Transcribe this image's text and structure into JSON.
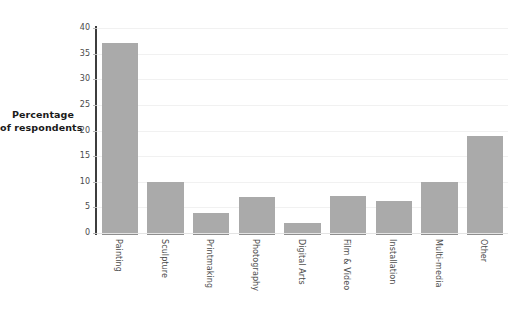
{
  "chart_data": {
    "type": "bar",
    "title": "",
    "subtitle": "",
    "xlabel": "",
    "ylabel": "Percentage of respondents",
    "ylabel_lines": [
      "Percentage",
      "of respondents"
    ],
    "categories": [
      "Painting",
      "Sculpture",
      "Printmaking",
      "Photography",
      "Digital Arts",
      "Film & Video",
      "Installation",
      "Multi-media",
      "Other"
    ],
    "values": [
      37,
      10,
      4,
      7,
      2,
      7.2,
      6.3,
      10,
      18.9
    ],
    "ylim": [
      0,
      40
    ],
    "ytick_values": [
      0,
      5,
      10,
      15,
      20,
      25,
      30,
      35,
      40
    ],
    "ytick_labels": [
      "0",
      "5",
      "10",
      "15",
      "20",
      "25",
      "30",
      "35",
      "40"
    ],
    "grid": true,
    "grid_axis": "y",
    "legend": false,
    "legend_position": "none",
    "bar_color": "#aaaaaa",
    "bar_baseline_color": "#8e8e8e",
    "gridline_color": "#f1f1f1",
    "axis_line_color": "#3d3d3d",
    "tick_color": "#b8b8b8",
    "label_color": "#4a4a4a",
    "title_color": "#1a1a1a",
    "background_color": "#ffffff",
    "xlabel_rotation": 90
  }
}
